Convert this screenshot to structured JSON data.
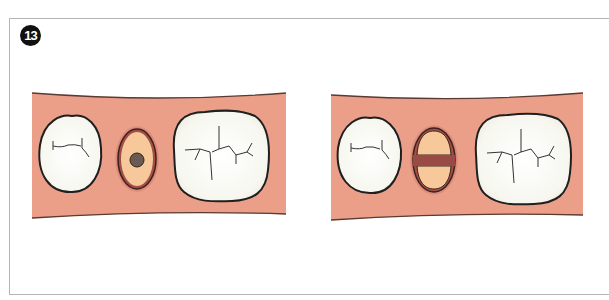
{
  "figure": {
    "number_badge": "13",
    "colors": {
      "gum": "#ec9f88",
      "gum_edge": "#5a3a33",
      "tooth_fill": "#fbfbf6",
      "tooth_outline": "#222222",
      "restoration_fill": "#f7c99a",
      "restoration_rim": "#8a3e3a",
      "restoration_dot": "#6a5a52",
      "frame": "#b5b5b5"
    },
    "panels": [
      {
        "label": "left-panel",
        "middle_element": "oval-with-center-dot"
      },
      {
        "label": "right-panel",
        "middle_element": "oval-with-horizontal-band"
      }
    ]
  }
}
